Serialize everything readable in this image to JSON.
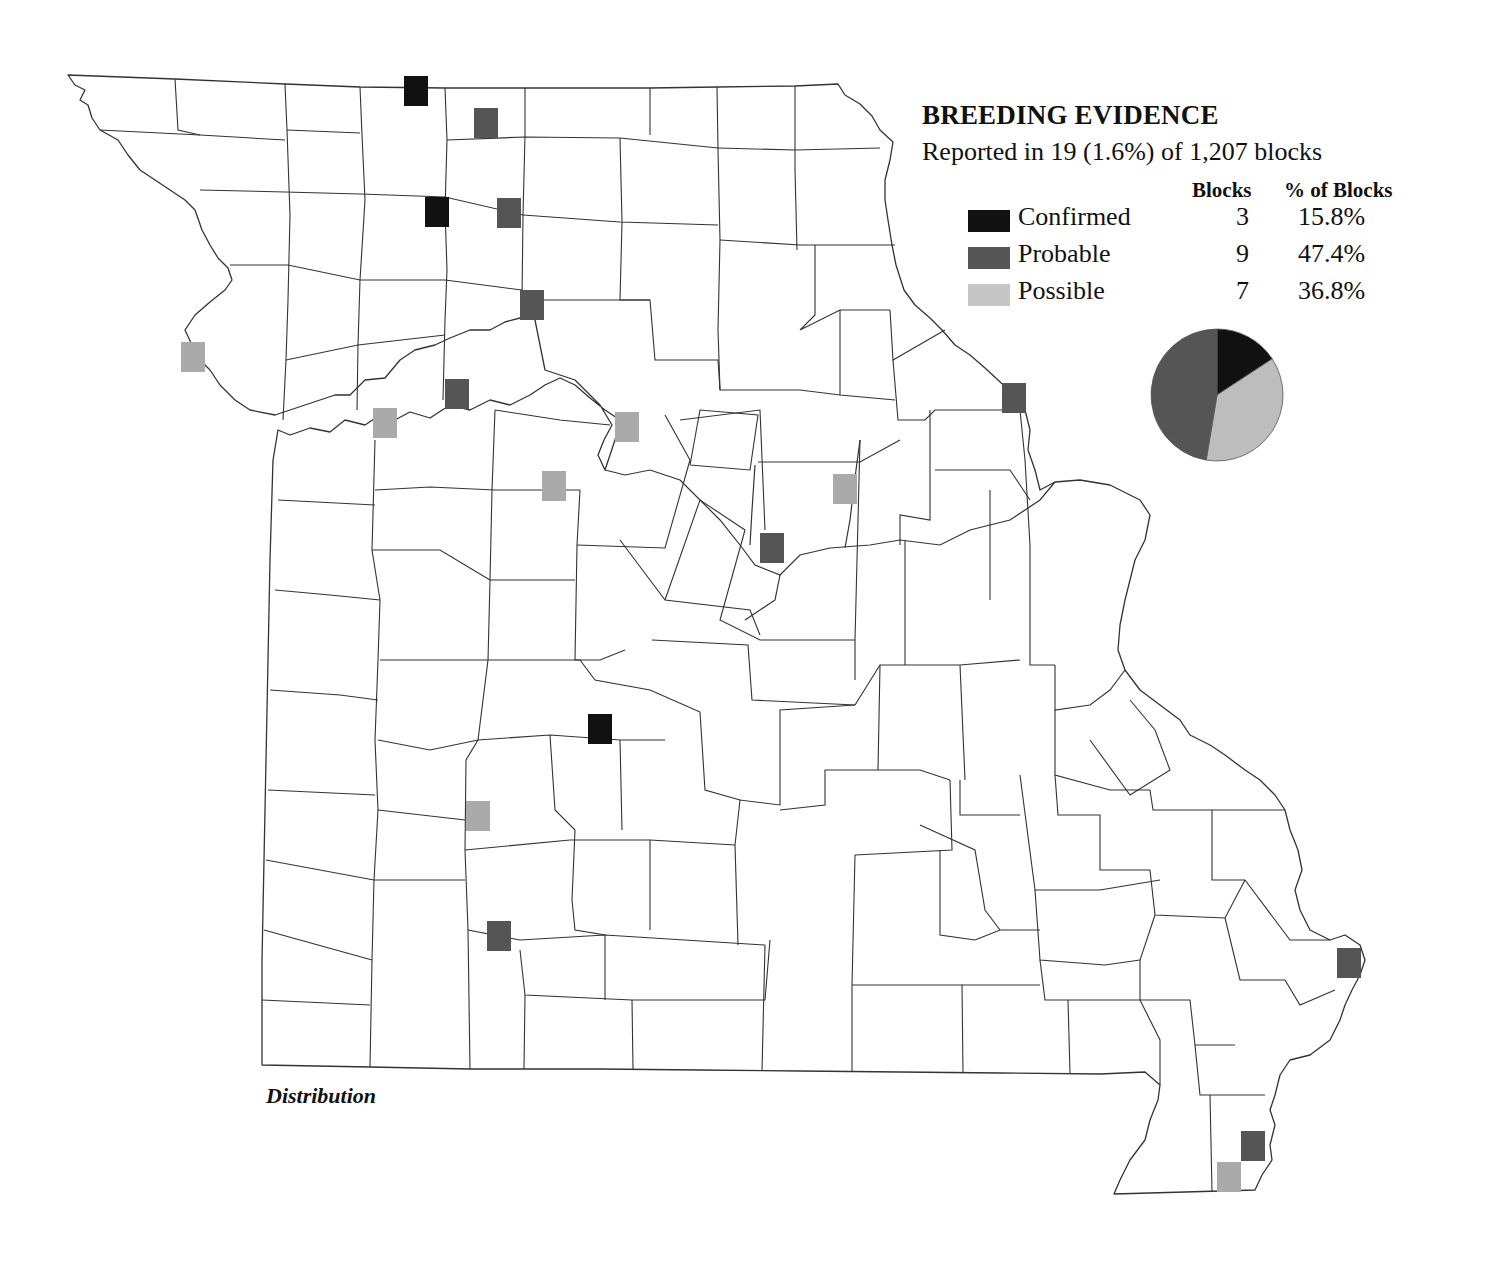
{
  "legend": {
    "title": "BREEDING EVIDENCE",
    "subtitle": "Reported in 19 (1.6%) of 1,207 blocks",
    "col_blocks": "Blocks",
    "col_pct": "% of Blocks",
    "rows": [
      {
        "label": "Confirmed",
        "blocks": "3",
        "pct": "15.8%",
        "color": "#111111"
      },
      {
        "label": "Probable",
        "blocks": "9",
        "pct": "47.4%",
        "color": "#555555"
      },
      {
        "label": "Possible",
        "blocks": "7",
        "pct": "36.8%",
        "color": "#c6c6c6"
      }
    ]
  },
  "map": {
    "caption": "Distribution",
    "marker_colors": {
      "confirmed": "#111111",
      "probable": "#555555",
      "possible": "#aaaaaa"
    },
    "markers": [
      {
        "type": "confirmed",
        "x": 416,
        "y": 91
      },
      {
        "type": "confirmed",
        "x": 437,
        "y": 212
      },
      {
        "type": "confirmed",
        "x": 600,
        "y": 729
      },
      {
        "type": "probable",
        "x": 486,
        "y": 123
      },
      {
        "type": "probable",
        "x": 509,
        "y": 213
      },
      {
        "type": "probable",
        "x": 532,
        "y": 305
      },
      {
        "type": "probable",
        "x": 457,
        "y": 394
      },
      {
        "type": "probable",
        "x": 1014,
        "y": 398
      },
      {
        "type": "probable",
        "x": 772,
        "y": 548
      },
      {
        "type": "probable",
        "x": 499,
        "y": 936
      },
      {
        "type": "probable",
        "x": 1349,
        "y": 963
      },
      {
        "type": "probable",
        "x": 1253,
        "y": 1146
      },
      {
        "type": "possible",
        "x": 193,
        "y": 357
      },
      {
        "type": "possible",
        "x": 385,
        "y": 423
      },
      {
        "type": "possible",
        "x": 627,
        "y": 427
      },
      {
        "type": "possible",
        "x": 554,
        "y": 486
      },
      {
        "type": "possible",
        "x": 845,
        "y": 489
      },
      {
        "type": "possible",
        "x": 478,
        "y": 816
      },
      {
        "type": "possible",
        "x": 1229,
        "y": 1177
      }
    ]
  },
  "chart_data": {
    "type": "pie",
    "title": "BREEDING EVIDENCE",
    "subtitle": "Reported in 19 (1.6%) of 1,207 blocks",
    "categories": [
      "Confirmed",
      "Possible",
      "Probable"
    ],
    "values": [
      3,
      7,
      9
    ],
    "percentages": [
      15.8,
      36.8,
      47.4
    ],
    "colors": [
      "#111111",
      "#bdbdbd",
      "#555555"
    ],
    "start_angle": "12 o'clock, clockwise",
    "legend_position": "above pie, right of map"
  }
}
